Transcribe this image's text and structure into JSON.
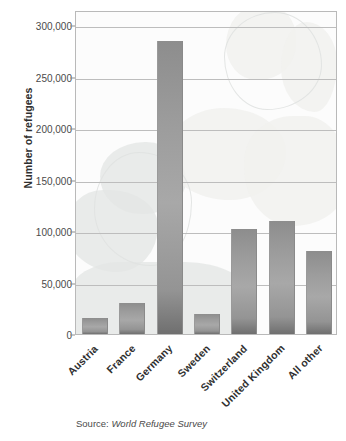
{
  "chart_data": {
    "type": "bar",
    "title": "",
    "subtitle": "",
    "xlabel": "",
    "ylabel": "Number of refugees",
    "categories": [
      "Austria",
      "France",
      "Germany",
      "Sweden",
      "Switzerland",
      "United Kingdom",
      "All other"
    ],
    "values": [
      16000,
      30000,
      285000,
      19000,
      102000,
      110000,
      81000
    ],
    "ylim": [
      0,
      315000
    ],
    "yticks": [
      0,
      50000,
      100000,
      150000,
      200000,
      250000,
      300000
    ],
    "ytick_labels": [
      "0",
      "50,000",
      "100,000",
      "150,000",
      "200,000",
      "250,000",
      "300,000"
    ],
    "grid": true,
    "legend": null,
    "bar_color": "#9c9c9c",
    "gridline_color": "#bdbdbd",
    "plot_border_color": "#b9b9b9",
    "background_watermark": "faint world map of europe"
  },
  "source": {
    "label": "Source:",
    "value": "World Refugee Survey"
  }
}
